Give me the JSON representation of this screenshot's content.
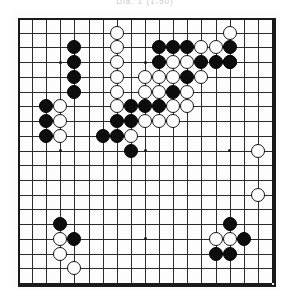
{
  "caption": {
    "text": "Dia.  1  (1-50)"
  },
  "board": {
    "name": "go-board",
    "size": 19,
    "line_color": "#2b2b2b",
    "edge_color": "#1a1a1a",
    "background_color": "#fdfdfd",
    "black_color": "#0d0d0d",
    "white_color": "#fefefe",
    "star_points": [
      [
        3,
        3
      ],
      [
        9,
        3
      ],
      [
        15,
        3
      ],
      [
        3,
        9
      ],
      [
        9,
        9
      ],
      [
        15,
        9
      ],
      [
        3,
        15
      ],
      [
        9,
        15
      ],
      [
        15,
        15
      ]
    ],
    "stones": [
      {
        "color": "white",
        "col": 7,
        "row": 1
      },
      {
        "color": "white",
        "col": 15,
        "row": 1
      },
      {
        "color": "black",
        "col": 4,
        "row": 2
      },
      {
        "color": "white",
        "col": 7,
        "row": 2
      },
      {
        "color": "black",
        "col": 10,
        "row": 2
      },
      {
        "color": "black",
        "col": 11,
        "row": 2
      },
      {
        "color": "black",
        "col": 12,
        "row": 2
      },
      {
        "color": "white",
        "col": 13,
        "row": 2
      },
      {
        "color": "white",
        "col": 14,
        "row": 2
      },
      {
        "color": "black",
        "col": 15,
        "row": 2
      },
      {
        "color": "black",
        "col": 4,
        "row": 3
      },
      {
        "color": "white",
        "col": 7,
        "row": 3
      },
      {
        "color": "black",
        "col": 10,
        "row": 3
      },
      {
        "color": "white",
        "col": 11,
        "row": 3
      },
      {
        "color": "white",
        "col": 12,
        "row": 3
      },
      {
        "color": "black",
        "col": 13,
        "row": 3
      },
      {
        "color": "black",
        "col": 14,
        "row": 3
      },
      {
        "color": "black",
        "col": 15,
        "row": 3
      },
      {
        "color": "black",
        "col": 4,
        "row": 4
      },
      {
        "color": "white",
        "col": 7,
        "row": 4
      },
      {
        "color": "white",
        "col": 9,
        "row": 4
      },
      {
        "color": "white",
        "col": 10,
        "row": 4
      },
      {
        "color": "white",
        "col": 11,
        "row": 4
      },
      {
        "color": "black",
        "col": 12,
        "row": 4
      },
      {
        "color": "white",
        "col": 13,
        "row": 4
      },
      {
        "color": "black",
        "col": 4,
        "row": 5
      },
      {
        "color": "white",
        "col": 7,
        "row": 5
      },
      {
        "color": "white",
        "col": 9,
        "row": 5
      },
      {
        "color": "white",
        "col": 10,
        "row": 5
      },
      {
        "color": "black",
        "col": 11,
        "row": 5
      },
      {
        "color": "white",
        "col": 12,
        "row": 5
      },
      {
        "color": "black",
        "col": 2,
        "row": 6
      },
      {
        "color": "white",
        "col": 3,
        "row": 6
      },
      {
        "color": "white",
        "col": 7,
        "row": 6
      },
      {
        "color": "black",
        "col": 8,
        "row": 6
      },
      {
        "color": "black",
        "col": 9,
        "row": 6
      },
      {
        "color": "black",
        "col": 10,
        "row": 6
      },
      {
        "color": "white",
        "col": 11,
        "row": 6
      },
      {
        "color": "white",
        "col": 12,
        "row": 6
      },
      {
        "color": "black",
        "col": 2,
        "row": 7
      },
      {
        "color": "white",
        "col": 3,
        "row": 7
      },
      {
        "color": "black",
        "col": 7,
        "row": 7
      },
      {
        "color": "black",
        "col": 8,
        "row": 7
      },
      {
        "color": "white",
        "col": 9,
        "row": 7
      },
      {
        "color": "white",
        "col": 10,
        "row": 7
      },
      {
        "color": "white",
        "col": 11,
        "row": 7
      },
      {
        "color": "black",
        "col": 2,
        "row": 8
      },
      {
        "color": "white",
        "col": 3,
        "row": 8
      },
      {
        "color": "black",
        "col": 6,
        "row": 8
      },
      {
        "color": "black",
        "col": 7,
        "row": 8
      },
      {
        "color": "white",
        "col": 8,
        "row": 8
      },
      {
        "color": "black",
        "col": 8,
        "row": 9
      },
      {
        "color": "black",
        "col": 15,
        "row": 3
      },
      {
        "color": "white",
        "col": 17,
        "row": 9
      },
      {
        "color": "white",
        "col": 17,
        "row": 12
      },
      {
        "color": "black",
        "col": 3,
        "row": 14
      },
      {
        "color": "white",
        "col": 3,
        "row": 15
      },
      {
        "color": "black",
        "col": 4,
        "row": 15
      },
      {
        "color": "white",
        "col": 3,
        "row": 16
      },
      {
        "color": "white",
        "col": 4,
        "row": 17
      },
      {
        "color": "black",
        "col": 15,
        "row": 14
      },
      {
        "color": "white",
        "col": 14,
        "row": 15
      },
      {
        "color": "white",
        "col": 15,
        "row": 15
      },
      {
        "color": "black",
        "col": 16,
        "row": 15
      },
      {
        "color": "black",
        "col": 14,
        "row": 16
      },
      {
        "color": "black",
        "col": 15,
        "row": 16
      }
    ]
  }
}
